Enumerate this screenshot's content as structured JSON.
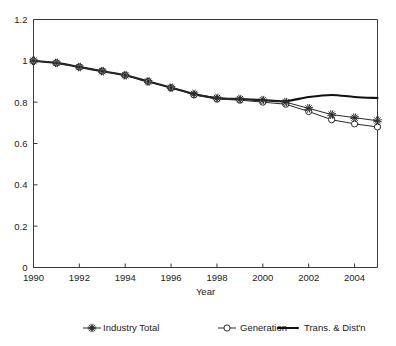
{
  "chart_data": {
    "type": "line",
    "title": "",
    "xlabel": "Year",
    "ylabel": "",
    "xlim": [
      1990,
      2005
    ],
    "ylim": [
      0,
      1.2
    ],
    "xticks": [
      1990,
      1992,
      1994,
      1996,
      1998,
      2000,
      2002,
      2004
    ],
    "xtick_labels": [
      "1990",
      "1992",
      "1994",
      "1996",
      "1998",
      "2000",
      "2002",
      "2004"
    ],
    "yticks": [
      0,
      0.2,
      0.4,
      0.6,
      0.8,
      1,
      1.2
    ],
    "ytick_labels": [
      "0",
      "0.2",
      "0.4",
      "0.6",
      "0.8",
      "1",
      "1.2"
    ],
    "grid": false,
    "legend_position": "bottom",
    "x": [
      1990,
      1991,
      1992,
      1993,
      1994,
      1995,
      1996,
      1997,
      1998,
      1999,
      2000,
      2001,
      2002,
      2003,
      2004,
      2005
    ],
    "series": [
      {
        "name": "Industry Total",
        "marker": "asterisk",
        "values": [
          1.0,
          0.99,
          0.97,
          0.95,
          0.93,
          0.9,
          0.87,
          0.84,
          0.82,
          0.815,
          0.81,
          0.8,
          0.77,
          0.74,
          0.725,
          0.71
        ]
      },
      {
        "name": "Generation",
        "marker": "circle",
        "values": [
          1.0,
          0.99,
          0.97,
          0.95,
          0.93,
          0.9,
          0.87,
          0.835,
          0.815,
          0.81,
          0.8,
          0.79,
          0.755,
          0.715,
          0.695,
          0.68
        ]
      },
      {
        "name": "Trans. & Dist'n",
        "marker": "none",
        "values": [
          1.0,
          0.99,
          0.97,
          0.95,
          0.93,
          0.9,
          0.87,
          0.84,
          0.82,
          0.815,
          0.81,
          0.805,
          0.825,
          0.835,
          0.825,
          0.82
        ]
      }
    ]
  },
  "legend": {
    "items": [
      {
        "label": "Industry Total",
        "marker": "asterisk"
      },
      {
        "label": "Generation",
        "marker": "circle"
      },
      {
        "label": "Trans. & Dist'n",
        "marker": "line"
      }
    ]
  },
  "colors": {
    "axis": "#3a3a3a",
    "series_thin": "#2a2a2a",
    "series_thick": "#111111",
    "background": "#ffffff"
  }
}
